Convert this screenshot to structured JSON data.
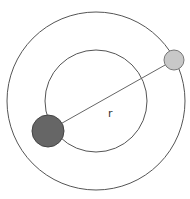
{
  "diagram": {
    "label_r": "r",
    "colors": {
      "orbit": "#555555",
      "line": "#666666",
      "dark_body": "#666666",
      "dark_body_stroke": "#444444",
      "light_body": "#c8c8c8",
      "light_body_stroke": "#777777",
      "background": "#ffffff"
    },
    "outer_orbit": {
      "cx": 96,
      "cy": 101,
      "r": 89
    },
    "inner_orbit": {
      "cx": 96,
      "cy": 101,
      "r": 51
    },
    "dark_body": {
      "cx": 48,
      "cy": 131,
      "r": 16
    },
    "light_body": {
      "cx": 174,
      "cy": 60,
      "r": 10
    },
    "label_position": {
      "x": 108,
      "y": 117
    }
  }
}
